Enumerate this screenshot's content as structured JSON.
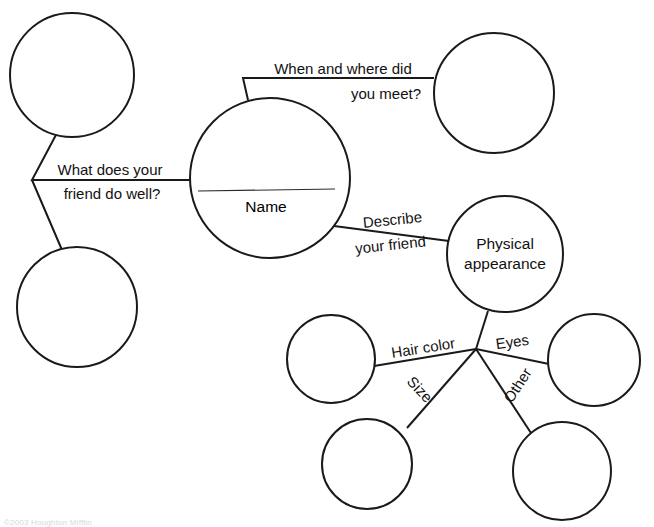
{
  "page": {
    "background_color": "#ffffff",
    "ink_color": "#1a1a1a",
    "width": 654,
    "height": 524
  },
  "center_node": {
    "label": "Name",
    "has_write_in_rule": true
  },
  "nodes": {
    "physical_appearance": "Physical appearance",
    "blank_top_left": "",
    "blank_bottom_left": "",
    "blank_top_right": "",
    "blank_hair_color": "",
    "blank_eyes": "",
    "blank_size": "",
    "blank_other": ""
  },
  "edge_labels": {
    "what_does_your_friend_do_well_line1": "What does your",
    "what_does_your_friend_do_well_line2": "friend do well?",
    "when_and_where_did_you_meet_line1": "When and where did",
    "when_and_where_did_you_meet_line2": "you meet?",
    "describe_your_friend_line1": "Describe",
    "describe_your_friend_line2": "your friend",
    "hair_color": "Hair color",
    "eyes": "Eyes",
    "size": "Size",
    "other": "Other"
  },
  "footer": {
    "note": "©2003 Houghton Mifflin"
  }
}
